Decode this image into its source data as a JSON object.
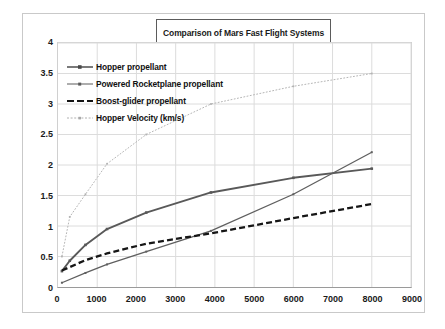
{
  "chart_data": {
    "type": "line",
    "title": "Comparison of Mars Fast Flight Systems",
    "xlabel": "",
    "ylabel": "",
    "xlim": [
      0,
      9000
    ],
    "ylim": [
      0,
      4
    ],
    "xticks": [
      "0",
      "1000",
      "2000",
      "3000",
      "4000",
      "5000",
      "6000",
      "7000",
      "8000",
      "9000"
    ],
    "yticks": [
      "0",
      "0.5",
      "1",
      "1.5",
      "2",
      "2.5",
      "3",
      "3.5",
      "4"
    ],
    "grid": true,
    "legend_position": "upper-left-inside",
    "series": [
      {
        "name": "Hopper propellant",
        "color": "#595959",
        "style": "solid-marker",
        "x": [
          100,
          300,
          700,
          1250,
          2250,
          3900,
          6000,
          8000
        ],
        "y": [
          0.26,
          0.43,
          0.69,
          0.95,
          1.22,
          1.55,
          1.79,
          1.94
        ]
      },
      {
        "name": "Powered Rocketplane propellant",
        "color": "#5f5f5f",
        "style": "solid-thin",
        "x": [
          100,
          700,
          1250,
          2250,
          3900,
          6000,
          8000
        ],
        "y": [
          0.07,
          0.23,
          0.37,
          0.58,
          0.92,
          1.52,
          2.21
        ]
      },
      {
        "name": "Boost-glider propellant",
        "color": "#161616",
        "style": "dashed",
        "x": [
          100,
          700,
          1250,
          2250,
          3900,
          6000,
          8000
        ],
        "y": [
          0.27,
          0.44,
          0.55,
          0.71,
          0.88,
          1.13,
          1.36
        ]
      },
      {
        "name": "Hopper Velocity (km/s)",
        "color": "#b4b4b4",
        "style": "dotted-light",
        "x": [
          100,
          300,
          700,
          1250,
          2250,
          3900,
          6000,
          8000
        ],
        "y": [
          0.5,
          1.15,
          1.52,
          2.02,
          2.5,
          3.0,
          3.29,
          3.5
        ]
      }
    ]
  },
  "legend": {
    "items": [
      {
        "label": "Hopper propellant"
      },
      {
        "label": "Powered Rocketplane propellant"
      },
      {
        "label": "Boost-glider propellant"
      },
      {
        "label": "Hopper Velocity (km/s)"
      }
    ]
  }
}
